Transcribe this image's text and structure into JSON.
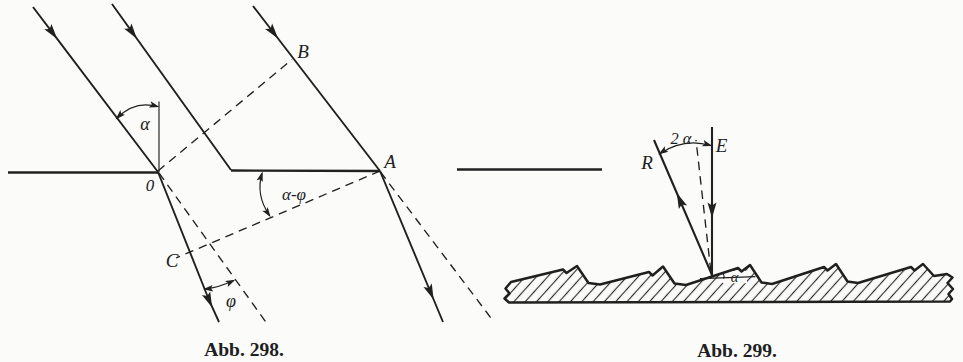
{
  "figure_298": {
    "caption": "Abb. 298.",
    "labels": {
      "alpha": "α",
      "point_o": "0",
      "point_a": "A",
      "point_b": "B",
      "point_c": "C",
      "alpha_minus_phi": "α-φ",
      "phi": "φ"
    }
  },
  "figure_299": {
    "caption": "Abb. 299.",
    "labels": {
      "two_alpha": "2 α",
      "ray_e": "E",
      "ray_r": "R",
      "alpha": "α"
    }
  },
  "colors": {
    "ink": "#202020",
    "paper": "#fbfbf9"
  }
}
